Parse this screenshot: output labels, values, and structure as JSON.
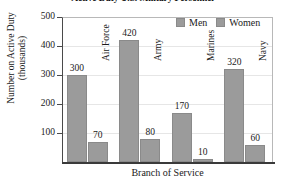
{
  "chart_data": {
    "type": "bar",
    "title": "Active Duty U.S. Military Personnel",
    "xlabel": "Branch of Service",
    "ylabel_line1": "Number on Active Duty",
    "ylabel_line2": "(thousands)",
    "categories": [
      "Air Force",
      "Army",
      "Marines",
      "Navy"
    ],
    "series": [
      {
        "name": "Men",
        "values": [
          300,
          420,
          170,
          320
        ],
        "color": "#9b9b9b"
      },
      {
        "name": "Women",
        "values": [
          70,
          80,
          10,
          60
        ],
        "color": "#9b9b9b"
      }
    ],
    "ylim": [
      0,
      500
    ],
    "yticks": [
      100,
      200,
      300,
      400,
      500
    ],
    "grid": true,
    "legend_position": "top-right",
    "value_labels": true
  },
  "legend": {
    "items": [
      {
        "label": "Men"
      },
      {
        "label": "Women"
      }
    ]
  }
}
